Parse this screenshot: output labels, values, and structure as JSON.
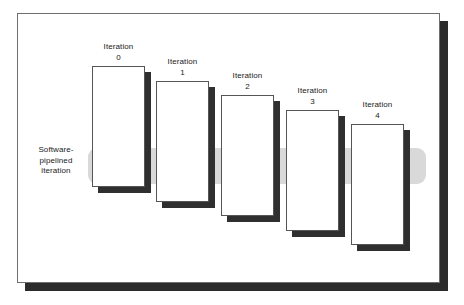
{
  "diagram": {
    "caption": {
      "line1": "Software-",
      "line2": "pipelined",
      "line3": "iteration"
    },
    "colors": {
      "frame_border": "#6f6f6f",
      "frame_shadow": "#2b2b2b",
      "box_border": "#555555",
      "box_fill": "#ffffff",
      "box_shadow": "#2f2f2f",
      "band_fill": "#d9d9d9",
      "text": "#1a1a1a",
      "page_background": "#ffffff"
    },
    "band": {
      "label": "software-pipelined-iteration-band",
      "left": 88,
      "top": 148,
      "width": 338,
      "height": 36
    },
    "iterations": [
      {
        "label_line1": "Iteration",
        "label_line2": "0",
        "left": 92,
        "top": 66,
        "width": 53,
        "height": 121
      },
      {
        "label_line1": "Iteration",
        "label_line2": "1",
        "left": 156,
        "top": 81,
        "width": 53,
        "height": 121
      },
      {
        "label_line1": "Iteration",
        "label_line2": "2",
        "left": 221,
        "top": 95,
        "width": 53,
        "height": 121
      },
      {
        "label_line1": "Iteration",
        "label_line2": "3",
        "left": 286,
        "top": 110,
        "width": 53,
        "height": 121
      },
      {
        "label_line1": "Iteration",
        "label_line2": "4",
        "left": 351,
        "top": 124,
        "width": 53,
        "height": 121
      }
    ]
  }
}
